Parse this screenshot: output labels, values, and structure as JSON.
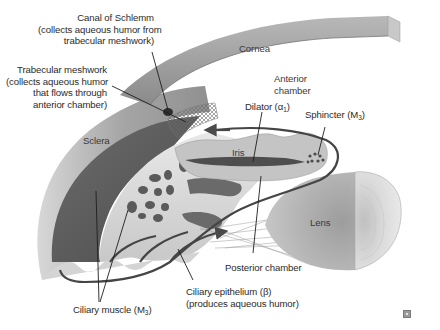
{
  "diagram": {
    "style": "grayscale anatomical cross-section",
    "structures": {
      "cornea": "Cornea",
      "anterior_chamber": [
        "Anterior",
        "chamber"
      ],
      "sclera": "Sclera",
      "iris": "Iris",
      "lens": "Lens"
    },
    "callouts": {
      "canal_of_schlemm": {
        "title": "Canal of Schlemm",
        "lines": [
          "(collects aqueous humor from",
          "trabecular meshwork)"
        ]
      },
      "trabecular_meshwork": {
        "title": "Trabecular meshwork",
        "lines": [
          "(collects aqueous humor",
          "that flows through",
          "anterior chamber)"
        ]
      },
      "dilator": {
        "name": "Dilator (α",
        "receptor_sub": "1",
        "close": ")"
      },
      "sphincter": {
        "name": "Sphincter (M",
        "receptor_sub": "3",
        "close": ")"
      },
      "posterior_chamber": "Posterior chamber",
      "ciliary_epithelium": {
        "title": "Ciliary epithelium (β)",
        "line": "(produces aqueous humor)"
      },
      "ciliary_muscle": {
        "name": "Ciliary muscle (M",
        "receptor_sub": "3",
        "close": ")"
      }
    },
    "flow_arrows": {
      "description": "Dark arrows trace aqueous humor flow from ciliary body through posterior chamber, around the iris into the anterior chamber, toward the trabecular meshwork",
      "color": "#4a4a4a"
    },
    "colors": {
      "background": "#ffffff",
      "cornea": "#9a9a9a",
      "sclera": "#a8a8a8",
      "ciliary_muscle": "#5e5e5e",
      "ciliary_body": "#d8d8d8",
      "iris": "#c8c8c8",
      "lens": "#b5b5b5",
      "lens_cut": "#d5d5d5",
      "label_text": "#2b2b2b"
    }
  }
}
